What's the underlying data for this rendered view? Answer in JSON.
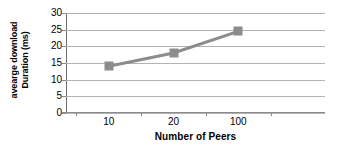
{
  "chart_data": {
    "type": "line",
    "title": "",
    "subtitle": "",
    "categories": [
      "10",
      "20",
      "100"
    ],
    "values": [
      14,
      18,
      24.5
    ],
    "series": [
      {
        "name": "average download Duration",
        "values": [
          14,
          18,
          24.5
        ]
      }
    ],
    "xlabel": "Number of Peers",
    "ylabel_line1": "avearge download",
    "ylabel_line2": "Duration (ms)",
    "ylabel": "avearge download Duration (ms)",
    "ylim": [
      0,
      30
    ],
    "yticks": [
      "0",
      "5",
      "10",
      "15",
      "20",
      "25",
      "30"
    ],
    "ytick_values": [
      0,
      5,
      10,
      15,
      20,
      25,
      30
    ],
    "grid": true,
    "legend": "none",
    "marker": "square",
    "colors": {
      "series_line": "#8c8c8c",
      "marker_fill": "#8c8c8c",
      "gridline": "#b3b3b3",
      "axis": "#8a8a8a",
      "background": "#ffffff",
      "text": "#000000"
    }
  }
}
